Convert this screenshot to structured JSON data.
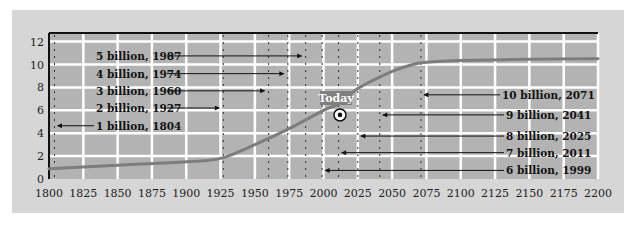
{
  "chart_data": {
    "type": "line",
    "title": "",
    "xlabel": "",
    "ylabel": "",
    "xlim": [
      1800,
      2200
    ],
    "ylim": [
      0,
      12.7
    ],
    "grid": true,
    "x_ticks": [
      1800,
      1825,
      1850,
      1875,
      1900,
      1925,
      1950,
      1975,
      2000,
      2025,
      2050,
      2075,
      2100,
      2125,
      2150,
      2175,
      2200
    ],
    "y_ticks": [
      0,
      2,
      4,
      6,
      8,
      10,
      12
    ],
    "series": [
      {
        "name": "World population (billions)",
        "x": [
          1800,
          1850,
          1900,
          1925,
          1950,
          1975,
          2000,
          2012,
          2025,
          2050,
          2065,
          2075,
          2100,
          2150,
          2200
        ],
        "y": [
          0.9,
          1.2,
          1.5,
          1.8,
          3.0,
          4.4,
          6.0,
          6.6,
          7.9,
          9.4,
          10.0,
          10.2,
          10.35,
          10.45,
          10.5
        ]
      }
    ],
    "milestones": [
      {
        "label": "1 billion, 1804",
        "year": 1804,
        "label_y": 4.65,
        "side": "left",
        "text_x": 96,
        "arrow_from": 94
      },
      {
        "label": "2 billion, 1927",
        "year": 1927,
        "label_y": 6.2,
        "side": "left",
        "text_x": 96,
        "arrow_from": 167
      },
      {
        "label": "3 billion, 1960",
        "year": 1960,
        "label_y": 7.7,
        "side": "left",
        "text_x": 96,
        "arrow_from": 167
      },
      {
        "label": "4 billion, 1974",
        "year": 1974,
        "label_y": 9.2,
        "side": "left",
        "text_x": 96,
        "arrow_from": 167
      },
      {
        "label": "5 billion, 1987",
        "year": 1987,
        "label_y": 10.75,
        "side": "left",
        "text_x": 96,
        "arrow_from": 167
      },
      {
        "label": "6 billion, 1999",
        "year": 1999,
        "label_y": 0.75,
        "side": "right",
        "text_x": 506,
        "arrow_from": 504
      },
      {
        "label": "7 billion, 2011",
        "year": 2011,
        "label_y": 2.3,
        "side": "right",
        "text_x": 506,
        "arrow_from": 504
      },
      {
        "label": "8 billion, 2025",
        "year": 2025,
        "label_y": 3.75,
        "side": "right",
        "text_x": 506,
        "arrow_from": 504
      },
      {
        "label": "9 billion, 2041",
        "year": 2041,
        "label_y": 5.6,
        "side": "right",
        "text_x": 506,
        "arrow_from": 504
      },
      {
        "label": "10 billion, 2071",
        "year": 2071,
        "label_y": 7.35,
        "side": "right",
        "text_x": 502,
        "arrow_from": 500
      }
    ],
    "annotation": {
      "label": "Today",
      "year": 2012,
      "value": 5.6
    },
    "colors": {
      "panel_bg": "#d6d6d6",
      "plot_bg": "#b3b3b3",
      "grid": "#ffffff",
      "curve": "#7d7d7d",
      "axis": "#111111",
      "today_box": "#808080"
    }
  }
}
